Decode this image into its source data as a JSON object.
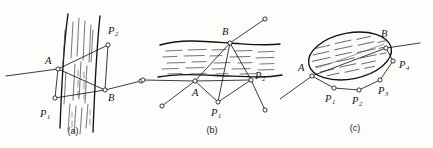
{
  "figure": {
    "background_color": "#fdfdfc",
    "ink_color": "#1a1a1a",
    "node_fill": "#ffffff",
    "panel_count": 3
  },
  "panels": [
    {
      "id": "a",
      "caption": "(a)",
      "obstacle": {
        "kind": "vertical-strip",
        "hatch_style": "vertical-dashes",
        "orientation": "vertical"
      },
      "labels": [
        {
          "key": "A",
          "base": "A",
          "sub": "",
          "x": 45,
          "y": 64
        },
        {
          "key": "B",
          "base": "B",
          "sub": "",
          "x": 108,
          "y": 101
        },
        {
          "key": "P1",
          "base": "P",
          "sub": "1",
          "x": 44,
          "y": 117
        },
        {
          "key": "P2",
          "base": "P",
          "sub": "2",
          "x": 111,
          "y": 34
        }
      ],
      "nodes": [
        {
          "key": "A",
          "x": 58,
          "y": 69
        },
        {
          "key": "B",
          "x": 105,
          "y": 90
        },
        {
          "key": "P1",
          "x": 55,
          "y": 98
        },
        {
          "key": "P2",
          "x": 108,
          "y": 45
        },
        {
          "key": "end-right",
          "x": 141,
          "y": 81
        }
      ]
    },
    {
      "id": "b",
      "caption": "(b)",
      "obstacle": {
        "kind": "horizontal-band",
        "hatch_style": "horizontal-dashes",
        "orientation": "horizontal"
      },
      "labels": [
        {
          "key": "A",
          "base": "A",
          "sub": "",
          "x": 52,
          "y": 96
        },
        {
          "key": "B",
          "base": "B",
          "sub": "",
          "x": 82,
          "y": 35
        },
        {
          "key": "P1",
          "base": "P",
          "sub": "1",
          "x": 75,
          "y": 114
        },
        {
          "key": "P2",
          "base": "P",
          "sub": "2",
          "x": 113,
          "y": 78
        }
      ],
      "nodes": [
        {
          "key": "A",
          "x": 55,
          "y": 81
        },
        {
          "key": "B",
          "x": 90,
          "y": 43
        },
        {
          "key": "P1",
          "x": 78,
          "y": 102
        },
        {
          "key": "P2",
          "x": 111,
          "y": 80
        },
        {
          "key": "end-left",
          "x": 3,
          "y": 80
        },
        {
          "key": "end-lower",
          "x": 22,
          "y": 106
        },
        {
          "key": "end-upper",
          "x": 125,
          "y": 19
        },
        {
          "key": "end-right",
          "x": 125,
          "y": 110
        }
      ]
    },
    {
      "id": "c",
      "caption": "(c)",
      "obstacle": {
        "kind": "ellipse",
        "hatch_style": "horizontal-dashes",
        "orientation": "tilted"
      },
      "labels": [
        {
          "key": "A",
          "base": "A",
          "sub": "",
          "x": 22,
          "y": 70
        },
        {
          "key": "B",
          "base": "B",
          "sub": "",
          "x": 104,
          "y": 36
        },
        {
          "key": "P1",
          "base": "P",
          "sub": "1",
          "x": 49,
          "y": 100
        },
        {
          "key": "P2",
          "base": "P",
          "sub": "2",
          "x": 76,
          "y": 101
        },
        {
          "key": "P3",
          "base": "P",
          "sub": "3",
          "x": 101,
          "y": 92
        },
        {
          "key": "P4",
          "base": "P",
          "sub": "4",
          "x": 122,
          "y": 66
        }
      ],
      "nodes": [
        {
          "key": "A",
          "x": 32,
          "y": 76
        },
        {
          "key": "B",
          "x": 106,
          "y": 48
        },
        {
          "key": "P1",
          "x": 54,
          "y": 88
        },
        {
          "key": "P2",
          "x": 79,
          "y": 90
        },
        {
          "key": "P3",
          "x": 100,
          "y": 80
        },
        {
          "key": "P4",
          "x": 113,
          "y": 61
        },
        {
          "key": "end-lower-left",
          "x": 0,
          "y": 99
        },
        {
          "key": "end-upper-right",
          "x": 140,
          "y": 43
        }
      ]
    }
  ],
  "captions": {
    "a": "(a)",
    "b": "(b)",
    "c": "(c)"
  }
}
